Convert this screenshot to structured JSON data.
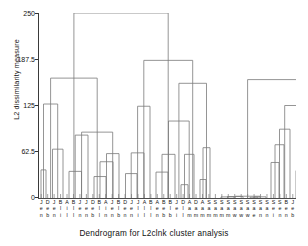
{
  "chart_data": {
    "type": "dendrogram",
    "title": "Dendrogram for L2clnk cluster analysis",
    "xlabel": "Dendrogram for L2clnk cluster analysis",
    "ylabel": "L2 dissimilarity measure",
    "ylim": [
      0,
      250
    ],
    "yticks": [
      0,
      62.5,
      125,
      187.5,
      250
    ],
    "ytick_labels": [
      "0",
      "62.5",
      "125",
      "187.5",
      "250"
    ],
    "grid": false,
    "legend": null,
    "n_leaves": 40,
    "leaf_labels": [
      [
        "J",
        "e",
        "n"
      ],
      [
        "D",
        "e",
        "b"
      ],
      [
        "J",
        "e",
        "n"
      ],
      [
        "B",
        "l",
        "i"
      ],
      [
        "A",
        "i",
        "l"
      ],
      [
        "B",
        "l",
        "l"
      ],
      [
        "J",
        "e",
        "n"
      ],
      [
        "J",
        "e",
        "n"
      ],
      [
        "D",
        "e",
        "b"
      ],
      [
        "B",
        "l",
        "l"
      ],
      [
        "A",
        "i",
        "n"
      ],
      [
        "J",
        "e",
        "n"
      ],
      [
        "B",
        "l",
        "b"
      ],
      [
        "D",
        "e",
        "n"
      ],
      [
        "J",
        "e",
        "n"
      ],
      [
        "J",
        "l",
        "i"
      ],
      [
        "A",
        "l",
        "l"
      ],
      [
        "B",
        "l",
        "l"
      ],
      [
        "A",
        "e",
        "n"
      ],
      [
        "B",
        "e",
        "b"
      ],
      [
        "B",
        "l",
        "b"
      ],
      [
        "J",
        "e",
        "i"
      ],
      [
        "D",
        "l",
        "l"
      ],
      [
        "A",
        "a",
        "m"
      ],
      [
        "D",
        "a",
        "m"
      ],
      [
        "A",
        "a",
        "m"
      ],
      [
        "S",
        "a",
        "m"
      ],
      [
        "S",
        "a",
        "m"
      ],
      [
        "S",
        "a",
        "m"
      ],
      [
        "S",
        "a",
        "m"
      ],
      [
        "S",
        "a",
        "w"
      ],
      [
        "S",
        "a",
        "w"
      ],
      [
        "S",
        "a",
        "w"
      ],
      [
        "S",
        "a",
        "e"
      ],
      [
        "S",
        "a",
        "n"
      ],
      [
        "S",
        "a",
        "n"
      ],
      [
        "S",
        "e",
        "i"
      ],
      [
        "S",
        "e",
        "n"
      ],
      [
        "B",
        "e",
        "n"
      ],
      [
        "J",
        "e",
        "b"
      ]
    ],
    "merges": [
      {
        "x1": 3.0,
        "x2": 8.0,
        "height": 38.0
      },
      {
        "x1": 14.5,
        "x2": 25.0,
        "height": 66.0
      },
      {
        "x1": 5.5,
        "x2": 19.7,
        "height": 127.0
      },
      {
        "x1": 31.0,
        "x2": 43.5,
        "height": 36.0
      },
      {
        "x1": 37.2,
        "x2": 50.0,
        "height": 85.0
      },
      {
        "x1": 56.0,
        "x2": 68.0,
        "height": 29.0
      },
      {
        "x1": 62.0,
        "x2": 75.0,
        "height": 49.0
      },
      {
        "x1": 68.5,
        "x2": 81.0,
        "height": 60.0
      },
      {
        "x1": 43.6,
        "x2": 74.7,
        "height": 89.0
      },
      {
        "x1": 12.6,
        "x2": 59.2,
        "height": 162.0
      },
      {
        "x1": 87.5,
        "x2": 99.0,
        "height": 33.0
      },
      {
        "x1": 93.2,
        "x2": 106.0,
        "height": 61.0
      },
      {
        "x1": 99.6,
        "x2": 112.0,
        "height": 124.0
      },
      {
        "x1": 118.0,
        "x2": 130.0,
        "height": 35.0
      },
      {
        "x1": 124.0,
        "x2": 137.0,
        "height": 59.0
      },
      {
        "x1": 143.0,
        "x2": 150.0,
        "height": 18.0
      },
      {
        "x1": 146.5,
        "x2": 156.0,
        "height": 59.0
      },
      {
        "x1": 130.5,
        "x2": 151.2,
        "height": 104.0
      },
      {
        "x1": 162.0,
        "x2": 168.0,
        "height": 25.0
      },
      {
        "x1": 165.0,
        "x2": 172.0,
        "height": 68.0
      },
      {
        "x1": 140.9,
        "x2": 168.5,
        "height": 155.0
      },
      {
        "x1": 105.8,
        "x2": 154.7,
        "height": 186.0
      },
      {
        "x1": 35.9,
        "x2": 130.2,
        "height": 250.0
      },
      {
        "x1": 183.0,
        "x2": 196.0,
        "height": 1.5
      },
      {
        "x1": 189.5,
        "x2": 205.0,
        "height": 2.0
      },
      {
        "x1": 212.0,
        "x2": 220.0,
        "height": 1.0
      },
      {
        "x1": 216.0,
        "x2": 228.0,
        "height": 1.6
      },
      {
        "x1": 197.2,
        "x2": 222.0,
        "height": 2.4
      },
      {
        "x1": 233.0,
        "x2": 241.0,
        "height": 48.0
      },
      {
        "x1": 237.0,
        "x2": 246.0,
        "height": 72.0
      },
      {
        "x1": 241.5,
        "x2": 252.0,
        "height": 93.0
      },
      {
        "x1": 258.0,
        "x2": 266.0,
        "height": 37.0
      },
      {
        "x1": 262.0,
        "x2": 271.0,
        "height": 85.0
      },
      {
        "x1": 275.0,
        "x2": 284.0,
        "height": 40.0
      },
      {
        "x1": 266.5,
        "x2": 279.5,
        "height": 142.0
      },
      {
        "x1": 246.7,
        "x2": 273.0,
        "height": 125.0
      },
      {
        "x1": 209.6,
        "x2": 259.8,
        "height": 160.0
      },
      {
        "x1": 285.0,
        "x2": 292.0,
        "height": 159.0
      }
    ]
  },
  "axis": {
    "y_title": "L2 dissimilarity measure",
    "tick_250": "250",
    "tick_1875": "187.5",
    "tick_125": "125",
    "tick_625": "62.5",
    "tick_0": "0"
  },
  "figure": {
    "caption": "Dendrogram for L2clnk cluster analysis"
  },
  "colors": {
    "line": "#7a7a7a",
    "axis": "#3a3a3a",
    "text": "#111111",
    "background": "#ffffff"
  }
}
